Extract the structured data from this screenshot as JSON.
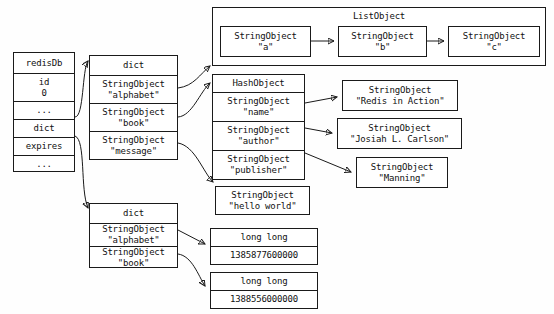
{
  "diagram": {
    "colors": {
      "stroke": "#1a1a1a",
      "box_fill": "#ffffff",
      "background": "#fefefe",
      "text": "#111111"
    }
  },
  "redis_db": {
    "header": "redisDb",
    "rows": [
      {
        "line1": "id",
        "line2": "0"
      },
      {
        "line1": "...",
        "line2": ""
      },
      {
        "line1": "dict",
        "line2": ""
      },
      {
        "line1": "expires",
        "line2": ""
      },
      {
        "line1": "...",
        "line2": ""
      }
    ]
  },
  "main_dict": {
    "header": "dict",
    "entries": [
      {
        "type": "StringObject",
        "value": "\"alphabet\""
      },
      {
        "type": "StringObject",
        "value": "\"book\""
      },
      {
        "type": "StringObject",
        "value": "\"message\""
      }
    ]
  },
  "expires_dict": {
    "header": "dict",
    "entries": [
      {
        "type": "StringObject",
        "value": "\"alphabet\""
      },
      {
        "type": "StringObject",
        "value": "\"book\""
      }
    ]
  },
  "list_object": {
    "title": "ListObject",
    "nodes": [
      {
        "type": "StringObject",
        "value": "\"a\""
      },
      {
        "type": "StringObject",
        "value": "\"b\""
      },
      {
        "type": "StringObject",
        "value": "\"c\""
      }
    ]
  },
  "hash_object": {
    "header": "HashObject",
    "fields": [
      {
        "type": "StringObject",
        "value": "\"name\""
      },
      {
        "type": "StringObject",
        "value": "\"author\""
      },
      {
        "type": "StringObject",
        "value": "\"publisher\""
      }
    ]
  },
  "hash_values": [
    {
      "type": "StringObject",
      "value": "\"Redis in Action\""
    },
    {
      "type": "StringObject",
      "value": "\"Josiah L. Carlson\""
    },
    {
      "type": "StringObject",
      "value": "\"Manning\""
    }
  ],
  "message_value": {
    "type": "StringObject",
    "value": "\"hello world\""
  },
  "expire_values": [
    {
      "type": "long long",
      "value": "1385877600000"
    },
    {
      "type": "long long",
      "value": "1388556000000"
    }
  ]
}
